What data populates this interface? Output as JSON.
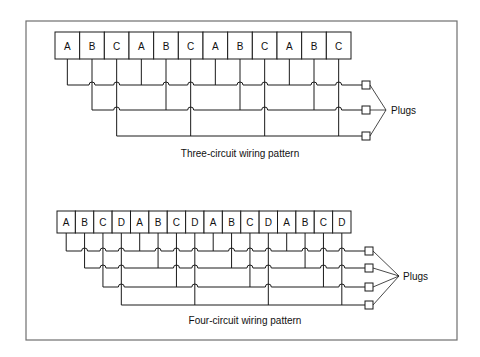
{
  "figure": {
    "frame": {
      "x": 26,
      "y": 21,
      "w": 431,
      "h": 319,
      "stroke": "#6f6f6f"
    },
    "ink": "#1a1a1a"
  },
  "diagrams": [
    {
      "id": "three-circuit",
      "caption": "Three-circuit wiring pattern",
      "caption_pos": {
        "x": 240,
        "y": 157
      },
      "strip": {
        "x": 55,
        "y": 32,
        "h": 27,
        "w": 296
      },
      "boxes": [
        "A",
        "B",
        "C",
        "A",
        "B",
        "C",
        "A",
        "B",
        "C",
        "A",
        "B",
        "C"
      ],
      "circuits": [
        "A",
        "B",
        "C"
      ],
      "rows_y": [
        85,
        110,
        136
      ],
      "plug_x": 362,
      "plug_size": 8,
      "plugs_label": "Plugs",
      "pointer": {
        "x": 386,
        "y": 110
      },
      "label_pos": {
        "x": 391,
        "y": 114
      }
    },
    {
      "id": "four-circuit",
      "caption": "Four-circuit wiring pattern",
      "caption_pos": {
        "x": 245,
        "y": 324
      },
      "strip": {
        "x": 57,
        "y": 211,
        "h": 22,
        "w": 294
      },
      "boxes": [
        "A",
        "B",
        "C",
        "D",
        "A",
        "B",
        "C",
        "D",
        "A",
        "B",
        "C",
        "D",
        "A",
        "B",
        "C",
        "D"
      ],
      "circuits": [
        "A",
        "B",
        "C",
        "D"
      ],
      "rows_y": [
        251,
        268,
        287,
        305
      ],
      "plug_x": 365,
      "plug_size": 8,
      "plugs_label": "Plugs",
      "pointer": {
        "x": 399,
        "y": 276
      },
      "label_pos": {
        "x": 403,
        "y": 280
      }
    }
  ]
}
